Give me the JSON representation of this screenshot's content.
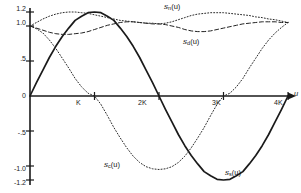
{
  "figure": {
    "background": "#ffffff",
    "ink": "#1a1a1a",
    "xlabel": "u",
    "ylabel": ""
  },
  "axes": {
    "x_ticks": [
      {
        "label": "K",
        "value": 1
      },
      {
        "label": "2K",
        "value": 2
      },
      {
        "label": "3K",
        "value": 3
      },
      {
        "label": "4K",
        "value": 4
      }
    ],
    "y_ticks": [
      {
        "label": "1.2",
        "value": 1.2
      },
      {
        "label": "1.0",
        "value": 1.0
      },
      {
        "label": ".5",
        "value": 0.5
      },
      {
        "label": "0",
        "value": 0.0
      },
      {
        "label": "-.5",
        "value": -0.5
      },
      {
        "label": "-1.0",
        "value": -1.0
      },
      {
        "label": "-1.2",
        "value": -1.2
      }
    ]
  },
  "curve_labels": {
    "sn": "s",
    "sn_sub": "n",
    "sn_arg": "(u)",
    "dn": "s",
    "dn_sub": "d",
    "dn_arg": "(u)",
    "cn": "s",
    "cn_sub": "c",
    "cn_arg": "(u)",
    "ss": "s",
    "ss_sub": "s",
    "ss_arg": "(u)"
  },
  "chart_data": {
    "type": "line",
    "title": "",
    "xlabel": "u",
    "ylabel": "",
    "xlim": [
      0,
      4
    ],
    "ylim": [
      -1.2,
      1.2
    ],
    "grid": false,
    "legend": "inline-annotations",
    "x_tick_labels": [
      "K",
      "2K",
      "3K",
      "4K"
    ],
    "x_tick_values": [
      1,
      2,
      3,
      4
    ],
    "y_tick_labels": [
      "1.2",
      "1.0",
      ".5",
      "0",
      "-.5",
      "-1.0",
      "-1.2"
    ],
    "y_tick_values": [
      1.2,
      1.0,
      0.5,
      0.0,
      -0.5,
      -1.0,
      -1.2
    ],
    "x": [
      0,
      0.1,
      0.2,
      0.3,
      0.4,
      0.5,
      0.6,
      0.7,
      0.8,
      0.9,
      1.0,
      1.1,
      1.2,
      1.3,
      1.4,
      1.5,
      1.6,
      1.7,
      1.8,
      1.9,
      2.0,
      2.1,
      2.2,
      2.3,
      2.4,
      2.5,
      2.6,
      2.7,
      2.8,
      2.9,
      3.0,
      3.1,
      3.2,
      3.3,
      3.4,
      3.5,
      3.6,
      3.7,
      3.8,
      3.9,
      4.0
    ],
    "series": [
      {
        "name": "s_s(u)",
        "style": "solid",
        "color": "#1a1a1a",
        "description": "solid sine-like curve from 0 up to 1.2 at u=K, back to 0 at 2K, down to -1.2 at 3K, back to 0 at 4K",
        "values": [
          0.0,
          0.19,
          0.37,
          0.55,
          0.71,
          0.85,
          0.97,
          1.08,
          1.14,
          1.19,
          1.2,
          1.19,
          1.14,
          1.08,
          0.97,
          0.85,
          0.71,
          0.55,
          0.37,
          0.19,
          0.0,
          -0.19,
          -0.37,
          -0.55,
          -0.71,
          -0.85,
          -0.97,
          -1.08,
          -1.14,
          -1.19,
          -1.2,
          -1.19,
          -1.14,
          -1.08,
          -0.97,
          -0.85,
          -0.71,
          -0.55,
          -0.37,
          -0.19,
          0.0
        ]
      },
      {
        "name": "s_c(u)",
        "style": "dotted",
        "color": "#2a2a2a",
        "description": "dotted cosine-like curve from 1.0 at u=0, crossing 0 near u=K, minimum about -1.05 near u=2K, returning to 1.05 at 4K",
        "values": [
          1.0,
          0.96,
          0.9,
          0.8,
          0.68,
          0.54,
          0.4,
          0.25,
          0.13,
          0.04,
          0.0,
          -0.12,
          -0.28,
          -0.45,
          -0.6,
          -0.74,
          -0.86,
          -0.95,
          -1.01,
          -1.04,
          -1.05,
          -1.04,
          -1.01,
          -0.95,
          -0.86,
          -0.74,
          -0.6,
          -0.45,
          -0.28,
          -0.12,
          0.0,
          0.04,
          0.13,
          0.25,
          0.4,
          0.54,
          0.68,
          0.8,
          0.9,
          0.98,
          1.05
        ]
      },
      {
        "name": "s_d(u)",
        "style": "dashed",
        "color": "#222222",
        "description": "dashed curve starting at 1.0, dipping to about 0.88 near u=0.9K, rising to about 1.06 near 2K, dipping again near 3K, back to 1.05 at 4K",
        "values": [
          1.0,
          0.97,
          0.94,
          0.91,
          0.89,
          0.88,
          0.88,
          0.89,
          0.9,
          0.92,
          0.95,
          0.98,
          1.01,
          1.03,
          1.05,
          1.06,
          1.06,
          1.05,
          1.04,
          1.03,
          1.03,
          1.02,
          1.0,
          0.98,
          0.95,
          0.93,
          0.92,
          0.92,
          0.93,
          0.95,
          0.97,
          0.99,
          1.01,
          1.03,
          1.04,
          1.05,
          1.06,
          1.06,
          1.06,
          1.05,
          1.05
        ]
      },
      {
        "name": "s_n(u)",
        "style": "dotted",
        "color": "#2a2a2a",
        "description": "upper dotted curve starting at 1.0, rising to about 1.2 near u=K, gently dipping to about 1.03 near 2K, rising to about 1.18 near 3K then falling back to 1.05 at 4K",
        "values": [
          1.0,
          1.05,
          1.1,
          1.14,
          1.17,
          1.19,
          1.2,
          1.2,
          1.19,
          1.18,
          1.16,
          1.14,
          1.12,
          1.1,
          1.08,
          1.07,
          1.06,
          1.05,
          1.04,
          1.04,
          1.03,
          1.04,
          1.06,
          1.09,
          1.12,
          1.15,
          1.17,
          1.18,
          1.19,
          1.19,
          1.19,
          1.18,
          1.17,
          1.16,
          1.15,
          1.13,
          1.12,
          1.1,
          1.09,
          1.07,
          1.05
        ]
      }
    ]
  }
}
